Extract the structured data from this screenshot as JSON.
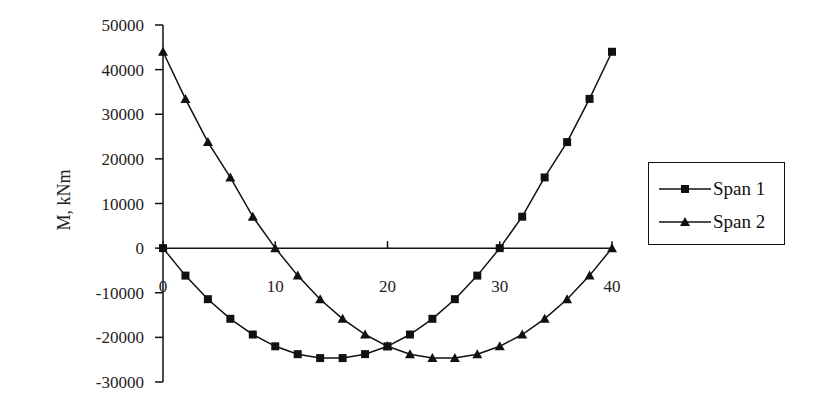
{
  "chart_data": {
    "type": "line",
    "title": "",
    "xlabel": "",
    "ylabel": "M, kNm",
    "xlim": [
      0,
      40
    ],
    "ylim": [
      -30000,
      50000
    ],
    "x_ticks": [
      0,
      10,
      20,
      30,
      40
    ],
    "y_ticks": [
      50000,
      40000,
      30000,
      20000,
      10000,
      0,
      -10000,
      -20000,
      -30000
    ],
    "grid": false,
    "legend_position": "right",
    "x": [
      0,
      2,
      4,
      6,
      8,
      10,
      12,
      14,
      16,
      18,
      20,
      22,
      24,
      26,
      28,
      30,
      32,
      34,
      36,
      38,
      40
    ],
    "series": [
      {
        "name": "Span 1",
        "marker": "square",
        "values": [
          0,
          -6160,
          -11440,
          -15840,
          -19360,
          -22000,
          -23760,
          -24640,
          -24640,
          -23760,
          -22000,
          -19360,
          -15840,
          -11440,
          -6160,
          0,
          7040,
          15840,
          23760,
          33440,
          44000
        ]
      },
      {
        "name": "Span 2",
        "marker": "triangle",
        "values": [
          44000,
          33440,
          23760,
          15840,
          7040,
          0,
          -6160,
          -11440,
          -15840,
          -19360,
          -22000,
          -23760,
          -24640,
          -24640,
          -23760,
          -22000,
          -19360,
          -15840,
          -11440,
          -6160,
          0
        ]
      }
    ]
  },
  "axes": {
    "y_title": "M, kNm",
    "y_tick_labels": [
      "50000",
      "40000",
      "30000",
      "20000",
      "10000",
      "0",
      "-10000",
      "-20000",
      "-30000"
    ],
    "x_tick_labels": [
      "0",
      "10",
      "20",
      "30",
      "40"
    ]
  },
  "legend": {
    "items": [
      {
        "label": "Span 1",
        "marker": "square"
      },
      {
        "label": "Span 2",
        "marker": "triangle"
      }
    ]
  },
  "colors": {
    "line": "#111111",
    "background": "#ffffff"
  }
}
